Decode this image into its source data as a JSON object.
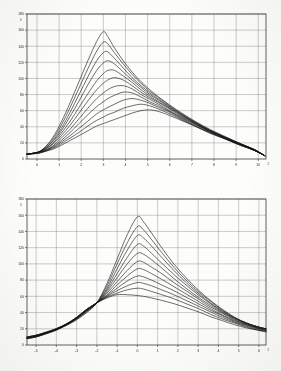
{
  "document": {
    "title": "Two line-chart panels (scanned figure)"
  },
  "panels": [
    {
      "name": "top-panel"
    },
    {
      "name": "bottom-panel"
    }
  ],
  "chart_data": [
    {
      "type": "line",
      "title": "",
      "xlabel": "",
      "ylabel": "",
      "panel": "top",
      "xlim": [
        -0.45,
        10.35
      ],
      "ylim": [
        0,
        180
      ],
      "grid": true,
      "legend_position": "none",
      "xticks": [
        0,
        1,
        2,
        3,
        4,
        5,
        6,
        7,
        8,
        9,
        10
      ],
      "xtick_labels": [
        "0",
        "1",
        "2",
        "3",
        "4",
        "5",
        "6",
        "7",
        "8",
        "9",
        "10"
      ],
      "x_axis_exponent": "2",
      "yticks": [
        0,
        20,
        40,
        60,
        80,
        100,
        120,
        140,
        160,
        180
      ],
      "ytick_labels": [
        "0",
        "20",
        "40",
        "60",
        "80",
        "100",
        "120",
        "140",
        "160",
        "180"
      ],
      "y_axis_exponent": "0",
      "x": [
        -0.45,
        0,
        0.3,
        0.7,
        1.1,
        1.5,
        1.9,
        2.3,
        2.7,
        3.0,
        3.2,
        3.5,
        3.9,
        4.3,
        4.7,
        5.1,
        5.5,
        6.0,
        6.6,
        7.2,
        7.8,
        8.5,
        9.2,
        9.8,
        10.3
      ],
      "series": [
        {
          "name": "curve-1",
          "values": [
            6,
            8,
            13,
            26,
            46,
            70,
            96,
            122,
            146,
            158,
            152,
            138,
            122,
            108,
            96,
            86,
            77,
            67,
            56,
            46,
            37,
            28,
            19,
            12,
            4
          ]
        },
        {
          "name": "curve-2",
          "values": [
            6,
            8,
            13,
            24,
            42,
            64,
            88,
            112,
            134,
            145,
            143,
            132,
            118,
            105,
            94,
            84,
            76,
            66,
            55,
            45,
            36,
            27,
            19,
            12,
            4
          ]
        },
        {
          "name": "curve-3",
          "values": [
            6,
            8,
            12,
            22,
            38,
            58,
            80,
            102,
            122,
            132,
            133,
            125,
            113,
            101,
            91,
            82,
            74,
            65,
            54,
            45,
            36,
            27,
            19,
            12,
            4
          ]
        },
        {
          "name": "curve-4",
          "values": [
            6,
            8,
            12,
            21,
            35,
            53,
            72,
            92,
            110,
            119,
            122,
            118,
            108,
            98,
            89,
            80,
            73,
            64,
            54,
            44,
            35,
            27,
            18,
            12,
            4
          ]
        },
        {
          "name": "curve-5",
          "values": [
            6,
            8,
            11,
            19,
            32,
            47,
            64,
            81,
            97,
            106,
            110,
            110,
            103,
            95,
            86,
            78,
            71,
            63,
            53,
            44,
            35,
            26,
            18,
            12,
            4
          ]
        },
        {
          "name": "curve-6",
          "values": [
            6,
            8,
            11,
            18,
            29,
            42,
            57,
            72,
            86,
            94,
            98,
            101,
            98,
            91,
            83,
            76,
            70,
            62,
            52,
            43,
            35,
            26,
            18,
            11,
            4
          ]
        },
        {
          "name": "curve-7",
          "values": [
            6,
            8,
            10,
            16,
            26,
            37,
            50,
            63,
            75,
            82,
            86,
            90,
            91,
            87,
            80,
            74,
            68,
            60,
            51,
            43,
            34,
            26,
            18,
            11,
            4
          ]
        },
        {
          "name": "curve-8",
          "values": [
            6,
            8,
            10,
            15,
            23,
            33,
            44,
            55,
            65,
            71,
            75,
            79,
            83,
            82,
            77,
            71,
            66,
            59,
            50,
            42,
            34,
            26,
            18,
            11,
            4
          ]
        },
        {
          "name": "curve-9",
          "values": [
            6,
            7,
            9,
            14,
            21,
            29,
            38,
            47,
            56,
            61,
            64,
            68,
            73,
            75,
            73,
            69,
            64,
            58,
            49,
            41,
            33,
            25,
            17,
            11,
            4
          ]
        },
        {
          "name": "curve-10",
          "values": [
            6,
            7,
            9,
            13,
            19,
            26,
            33,
            41,
            48,
            52,
            55,
            58,
            63,
            66,
            68,
            66,
            62,
            56,
            48,
            40,
            33,
            25,
            17,
            11,
            4
          ]
        },
        {
          "name": "curve-11",
          "values": [
            6,
            7,
            9,
            12,
            17,
            23,
            29,
            35,
            41,
            44,
            46,
            49,
            53,
            57,
            60,
            61,
            59,
            54,
            47,
            40,
            32,
            25,
            17,
            11,
            4
          ]
        }
      ]
    },
    {
      "type": "line",
      "title": "",
      "xlabel": "",
      "ylabel": "",
      "panel": "bottom",
      "xlim": [
        -5.45,
        6.35
      ],
      "ylim": [
        0,
        180
      ],
      "grid": true,
      "legend_position": "none",
      "xticks": [
        -5,
        -4,
        -3,
        -2,
        -1,
        0,
        1,
        2,
        3,
        4,
        5,
        6
      ],
      "xtick_labels": [
        "-5",
        "-4",
        "-3",
        "-2",
        "-1",
        "0",
        "1",
        "2",
        "3",
        "4",
        "5",
        "6"
      ],
      "x_axis_exponent": "2",
      "yticks": [
        0,
        20,
        40,
        60,
        80,
        100,
        120,
        140,
        160,
        180
      ],
      "ytick_labels": [
        "0",
        "20",
        "40",
        "60",
        "80",
        "100",
        "120",
        "140",
        "160",
        "180"
      ],
      "y_axis_exponent": "0",
      "x": [
        -5.45,
        -5.0,
        -4.5,
        -4.0,
        -3.5,
        -3.0,
        -2.5,
        -2.0,
        -1.5,
        -1.0,
        -0.5,
        0.0,
        0.3,
        0.7,
        1.2,
        1.8,
        2.4,
        3.0,
        3.6,
        4.2,
        4.8,
        5.4,
        6.0,
        6.35
      ],
      "series": [
        {
          "name": "curve-1",
          "values": [
            10,
            12,
            15,
            19,
            24,
            31,
            40,
            52,
            76,
            106,
            136,
            158,
            152,
            138,
            120,
            100,
            83,
            68,
            55,
            44,
            34,
            27,
            22,
            20
          ]
        },
        {
          "name": "curve-2",
          "values": [
            10,
            12,
            15,
            19,
            25,
            32,
            41,
            52,
            73,
            100,
            126,
            146,
            142,
            130,
            114,
            96,
            80,
            66,
            54,
            43,
            34,
            27,
            22,
            20
          ]
        },
        {
          "name": "curve-3",
          "values": [
            10,
            12,
            16,
            20,
            25,
            32,
            42,
            52,
            70,
            94,
            117,
            135,
            132,
            122,
            108,
            92,
            77,
            64,
            52,
            42,
            33,
            27,
            22,
            20
          ]
        },
        {
          "name": "curve-4",
          "values": [
            9,
            12,
            16,
            20,
            26,
            33,
            42,
            52,
            68,
            88,
            108,
            124,
            122,
            113,
            101,
            87,
            74,
            62,
            51,
            41,
            33,
            26,
            22,
            20
          ]
        },
        {
          "name": "curve-5",
          "values": [
            9,
            11,
            15,
            20,
            26,
            33,
            43,
            52,
            66,
            83,
            100,
            113,
            112,
            105,
            95,
            82,
            70,
            59,
            49,
            40,
            32,
            26,
            21,
            19
          ]
        },
        {
          "name": "curve-6",
          "values": [
            9,
            11,
            15,
            20,
            26,
            34,
            43,
            52,
            64,
            78,
            92,
            103,
            102,
            96,
            88,
            77,
            67,
            57,
            47,
            39,
            31,
            25,
            21,
            19
          ]
        },
        {
          "name": "curve-7",
          "values": [
            9,
            11,
            15,
            20,
            26,
            34,
            44,
            52,
            62,
            74,
            85,
            94,
            93,
            88,
            81,
            72,
            63,
            54,
            45,
            37,
            30,
            25,
            20,
            18
          ]
        },
        {
          "name": "curve-8",
          "values": [
            8,
            11,
            15,
            19,
            26,
            34,
            44,
            52,
            61,
            70,
            79,
            85,
            84,
            80,
            74,
            67,
            59,
            51,
            43,
            36,
            29,
            24,
            20,
            18
          ]
        },
        {
          "name": "curve-9",
          "values": [
            8,
            10,
            14,
            19,
            25,
            34,
            44,
            52,
            60,
            67,
            73,
            77,
            76,
            73,
            68,
            62,
            55,
            48,
            41,
            34,
            28,
            23,
            19,
            17
          ]
        },
        {
          "name": "curve-10",
          "values": [
            8,
            10,
            14,
            19,
            25,
            33,
            44,
            52,
            59,
            64,
            68,
            70,
            69,
            66,
            62,
            57,
            51,
            45,
            38,
            32,
            27,
            22,
            18,
            17
          ]
        },
        {
          "name": "curve-11",
          "values": [
            8,
            10,
            14,
            18,
            25,
            33,
            43,
            52,
            58,
            62,
            62,
            61,
            60,
            58,
            55,
            51,
            46,
            41,
            35,
            30,
            25,
            21,
            18,
            16
          ]
        }
      ]
    }
  ]
}
